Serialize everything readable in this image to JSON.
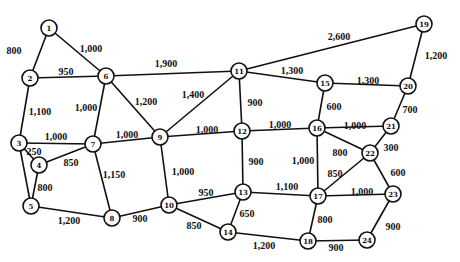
{
  "diagram": {
    "type": "weighted-network",
    "node_radius": 8,
    "nodes": [
      {
        "id": "1",
        "x": 49,
        "y": 28
      },
      {
        "id": "2",
        "x": 30,
        "y": 78
      },
      {
        "id": "3",
        "x": 19,
        "y": 143
      },
      {
        "id": "4",
        "x": 39,
        "y": 165
      },
      {
        "id": "5",
        "x": 31,
        "y": 206
      },
      {
        "id": "6",
        "x": 106,
        "y": 76
      },
      {
        "id": "7",
        "x": 93,
        "y": 144
      },
      {
        "id": "8",
        "x": 112,
        "y": 218
      },
      {
        "id": "9",
        "x": 160,
        "y": 137
      },
      {
        "id": "10",
        "x": 169,
        "y": 205
      },
      {
        "id": "11",
        "x": 239,
        "y": 71
      },
      {
        "id": "12",
        "x": 242,
        "y": 131
      },
      {
        "id": "13",
        "x": 243,
        "y": 192
      },
      {
        "id": "14",
        "x": 228,
        "y": 232
      },
      {
        "id": "15",
        "x": 325,
        "y": 83
      },
      {
        "id": "16",
        "x": 317,
        "y": 128
      },
      {
        "id": "17",
        "x": 318,
        "y": 196
      },
      {
        "id": "18",
        "x": 308,
        "y": 241
      },
      {
        "id": "19",
        "x": 424,
        "y": 24
      },
      {
        "id": "20",
        "x": 408,
        "y": 86
      },
      {
        "id": "21",
        "x": 391,
        "y": 126
      },
      {
        "id": "22",
        "x": 370,
        "y": 153
      },
      {
        "id": "23",
        "x": 393,
        "y": 194
      },
      {
        "id": "24",
        "x": 367,
        "y": 240
      }
    ],
    "edges": [
      {
        "from": "1",
        "to": "2",
        "label": "800",
        "lx": 14,
        "ly": 50
      },
      {
        "from": "1",
        "to": "6",
        "label": "1,000",
        "lx": 91,
        "ly": 48
      },
      {
        "from": "2",
        "to": "6",
        "label": "950",
        "lx": 66,
        "ly": 71
      },
      {
        "from": "2",
        "to": "3",
        "label": "1,100",
        "lx": 40,
        "ly": 111
      },
      {
        "from": "6",
        "to": "7",
        "label": "1,000",
        "lx": 86,
        "ly": 107
      },
      {
        "from": "6",
        "to": "9",
        "label": "1,200",
        "lx": 146,
        "ly": 101
      },
      {
        "from": "6",
        "to": "11",
        "label": "1,900",
        "lx": 166,
        "ly": 63
      },
      {
        "from": "3",
        "to": "7",
        "label": "1,000",
        "lx": 56,
        "ly": 136
      },
      {
        "from": "3",
        "to": "4",
        "label": "250",
        "lx": 34,
        "ly": 151
      },
      {
        "from": "3",
        "to": "5",
        "label": "",
        "lx": 0,
        "ly": 0
      },
      {
        "from": "4",
        "to": "7",
        "label": "850",
        "lx": 71,
        "ly": 162
      },
      {
        "from": "4",
        "to": "5",
        "label": "800",
        "lx": 45,
        "ly": 187
      },
      {
        "from": "7",
        "to": "9",
        "label": "1,000",
        "lx": 127,
        "ly": 134
      },
      {
        "from": "7",
        "to": "8",
        "label": "1,150",
        "lx": 114,
        "ly": 174
      },
      {
        "from": "5",
        "to": "8",
        "label": "1,200",
        "lx": 69,
        "ly": 220
      },
      {
        "from": "8",
        "to": "10",
        "label": "900",
        "lx": 140,
        "ly": 218
      },
      {
        "from": "9",
        "to": "11",
        "label": "1,400",
        "lx": 193,
        "ly": 94
      },
      {
        "from": "9",
        "to": "12",
        "label": "1,000",
        "lx": 207,
        "ly": 129
      },
      {
        "from": "9",
        "to": "10",
        "label": "1,000",
        "lx": 183,
        "ly": 171
      },
      {
        "from": "11",
        "to": "12",
        "label": "900",
        "lx": 255,
        "ly": 102
      },
      {
        "from": "11",
        "to": "15",
        "label": "1,300",
        "lx": 292,
        "ly": 70
      },
      {
        "from": "11",
        "to": "19",
        "label": "2,600",
        "lx": 339,
        "ly": 36
      },
      {
        "from": "12",
        "to": "16",
        "label": "1,000",
        "lx": 280,
        "ly": 124
      },
      {
        "from": "12",
        "to": "13",
        "label": "900",
        "lx": 256,
        "ly": 161
      },
      {
        "from": "10",
        "to": "13",
        "label": "950",
        "lx": 206,
        "ly": 192
      },
      {
        "from": "10",
        "to": "14",
        "label": "850",
        "lx": 194,
        "ly": 225
      },
      {
        "from": "13",
        "to": "14",
        "label": "650",
        "lx": 247,
        "ly": 213
      },
      {
        "from": "13",
        "to": "17",
        "label": "1,100",
        "lx": 287,
        "ly": 186
      },
      {
        "from": "14",
        "to": "18",
        "label": "1,200",
        "lx": 264,
        "ly": 245
      },
      {
        "from": "15",
        "to": "20",
        "label": "1,300",
        "lx": 368,
        "ly": 80
      },
      {
        "from": "15",
        "to": "16",
        "label": "600",
        "lx": 334,
        "ly": 106
      },
      {
        "from": "19",
        "to": "20",
        "label": "1,200",
        "lx": 436,
        "ly": 55
      },
      {
        "from": "20",
        "to": "21",
        "label": "700",
        "lx": 410,
        "ly": 109
      },
      {
        "from": "16",
        "to": "21",
        "label": "1,000",
        "lx": 355,
        "ly": 125
      },
      {
        "from": "16",
        "to": "22",
        "label": "800",
        "lx": 340,
        "ly": 152
      },
      {
        "from": "16",
        "to": "17",
        "label": "1,000",
        "lx": 303,
        "ly": 160
      },
      {
        "from": "21",
        "to": "22",
        "label": "300",
        "lx": 391,
        "ly": 147
      },
      {
        "from": "22",
        "to": "17",
        "label": "850",
        "lx": 335,
        "ly": 173
      },
      {
        "from": "22",
        "to": "23",
        "label": "600",
        "lx": 398,
        "ly": 172
      },
      {
        "from": "17",
        "to": "23",
        "label": "1,000",
        "lx": 362,
        "ly": 191
      },
      {
        "from": "17",
        "to": "18",
        "label": "800",
        "lx": 325,
        "ly": 219
      },
      {
        "from": "18",
        "to": "24",
        "label": "900",
        "lx": 336,
        "ly": 247
      },
      {
        "from": "23",
        "to": "24",
        "label": "900",
        "lx": 393,
        "ly": 226
      }
    ]
  }
}
